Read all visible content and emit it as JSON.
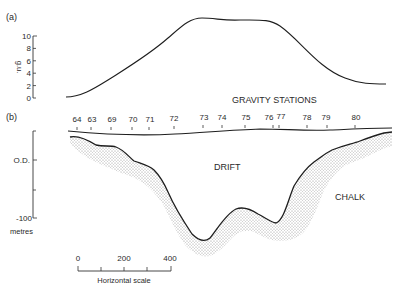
{
  "panel_a": {
    "label": "(a)",
    "y_axis": {
      "unit": "g.u.",
      "ticks": [
        "10",
        "8",
        "6",
        "4",
        "2",
        "0"
      ]
    },
    "caption": "GRAVITY STATIONS"
  },
  "panel_b": {
    "label": "(b)",
    "stations": [
      "64",
      "63",
      "69",
      "70",
      "71",
      "72",
      "73",
      "74",
      "75",
      "76",
      "77",
      "78",
      "79",
      "80"
    ],
    "depth_axis": {
      "od_label": "O.D.",
      "bottom_label": "-100",
      "unit": "metres"
    },
    "regions": {
      "drift": "DRIFT",
      "chalk": "CHALK"
    },
    "scale_bar": {
      "ticks": [
        "0",
        "200",
        "400"
      ],
      "caption": "Horizontal scale"
    }
  },
  "colors": {
    "line": "#1e1e1e",
    "stipple": "#8a8a8a",
    "text": "#2a2a2a"
  }
}
